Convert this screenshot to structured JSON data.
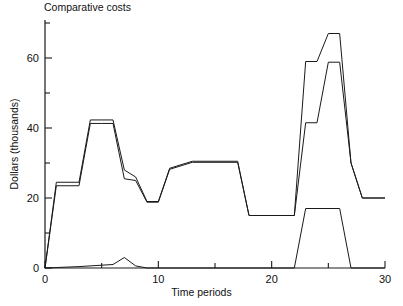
{
  "figure": {
    "title": "Comparative costs",
    "xlabel": "Time periods",
    "ylabel": "Dollars (thousands)"
  },
  "chart_data": {
    "type": "line",
    "title": "Comparative costs",
    "xlabel": "Time periods",
    "ylabel": "Dollars (thousands)",
    "xlim": [
      0,
      30
    ],
    "ylim": [
      0,
      72
    ],
    "grid": false,
    "legend": "none",
    "xticks_major": [
      0,
      10,
      20,
      30
    ],
    "xticks_minor": [
      5,
      15,
      25
    ],
    "yticks_major": [
      0,
      20,
      40,
      60
    ],
    "yticks_minor": [
      10,
      30,
      50,
      70
    ],
    "line_color": "#1a1a1a",
    "series": [
      {
        "name": "upper-cost-curve-a",
        "x": [
          0,
          1,
          3,
          3,
          4,
          5,
          6,
          6,
          7,
          8,
          9,
          10,
          11,
          11,
          13,
          13,
          17,
          17,
          18,
          18,
          22,
          22,
          23,
          23,
          24,
          24,
          25,
          26,
          26,
          27,
          28,
          28,
          30
        ],
        "y": [
          0,
          24.5,
          24.5,
          24.5,
          42.3,
          42.3,
          42.3,
          42.3,
          28.0,
          26.0,
          19.0,
          19.0,
          28.5,
          28.5,
          30.5,
          30.5,
          30.5,
          30.5,
          15.0,
          15.0,
          15.0,
          15.0,
          59.0,
          59.0,
          59.0,
          59.0,
          67.0,
          67.0,
          67.0,
          30.0,
          20.0,
          20.0,
          20.0
        ]
      },
      {
        "name": "upper-cost-curve-b",
        "x": [
          0,
          1,
          3,
          3,
          4,
          5,
          6,
          6,
          7,
          8,
          9,
          10,
          11,
          11,
          13,
          13,
          17,
          17,
          18,
          18,
          22,
          22,
          23,
          23,
          24,
          24,
          25,
          26,
          26,
          27,
          28,
          28,
          30
        ],
        "y": [
          0,
          23.5,
          23.5,
          23.5,
          41.3,
          41.3,
          41.3,
          41.3,
          25.5,
          25.0,
          18.8,
          18.8,
          28.2,
          28.2,
          30.2,
          30.2,
          30.2,
          30.2,
          15.0,
          15.0,
          15.0,
          15.0,
          41.5,
          41.5,
          41.5,
          41.5,
          58.8,
          58.8,
          58.8,
          30.0,
          20.0,
          20.0,
          20.0
        ]
      },
      {
        "name": "lower-cost-curve",
        "x": [
          0,
          3,
          5,
          6,
          7,
          7,
          8,
          9,
          22,
          23,
          26,
          27,
          30
        ],
        "y": [
          0,
          0.4,
          0.8,
          1.0,
          3.0,
          3.0,
          0.6,
          0.0,
          0.0,
          17.0,
          17.0,
          0.0,
          0.0
        ]
      }
    ]
  }
}
